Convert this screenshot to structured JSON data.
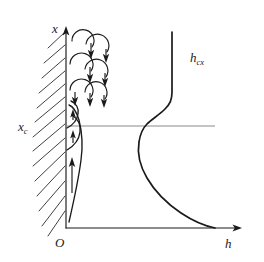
{
  "figure": {
    "background_color": "#ffffff",
    "ink_color": "#1a1a1a",
    "reference_line_color": "#8a8a8a",
    "width": 264,
    "height": 262
  },
  "axes": {
    "vertical": {
      "label": "x",
      "name": "vertical-axis",
      "direction": "up",
      "x_px": 66,
      "y_top_px": 28,
      "y_bottom_px": 228
    },
    "horizontal": {
      "label": "h",
      "name": "horizontal-axis",
      "direction": "right",
      "y_px": 228,
      "x_left_px": 66,
      "x_right_px": 240
    },
    "origin": {
      "label": "O",
      "x_px": 66,
      "y_px": 228
    }
  },
  "markers": {
    "critical_point": {
      "label": "x",
      "sublabel": "c",
      "description": "critical transition height where flow becomes turbulent",
      "y_px": 126,
      "line_start_x_px": 66,
      "line_end_x_px": 215
    }
  },
  "curve": {
    "label": "h",
    "sublabel": "cx",
    "name": "local-heat-transfer-coefficient-curve",
    "description": "local heat transfer coefficient h as a function of height x; high near the leading edge, decreasing through the laminar region, rising sharply at transition, then nearly constant in the turbulent region",
    "label_position": {
      "x_px": 192,
      "y_px": 62
    }
  },
  "regions": [
    {
      "name": "turbulent-region",
      "label": "",
      "description": "turbulent eddies above the critical height",
      "y_range_px": [
        28,
        112
      ],
      "eddy_count": 6,
      "arrow_direction": "down"
    },
    {
      "name": "laminar-region",
      "label": "",
      "description": "laminar boundary layer below the critical height",
      "y_range_px": [
        112,
        228
      ],
      "arrow_direction": "up"
    }
  ],
  "wall": {
    "name": "hatched-wall",
    "description": "vertical heated plate shown with diagonal hatching on its left side",
    "hatch_count": 13,
    "x_px": 66
  }
}
